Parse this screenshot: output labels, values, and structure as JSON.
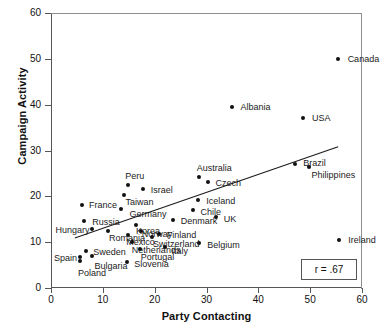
{
  "chart_data": {
    "type": "scatter",
    "title": "",
    "xlabel": "Party Contacting",
    "ylabel": "Campaign Activity",
    "xlim": [
      0,
      60
    ],
    "ylim": [
      0,
      60
    ],
    "xticks": [
      0,
      10,
      20,
      30,
      40,
      50,
      60
    ],
    "yticks": [
      0,
      10,
      20,
      30,
      40,
      50,
      60
    ],
    "grid": false,
    "legend": "none",
    "annotation": "r = .67",
    "correlation": 0.67,
    "trendline": {
      "x": [
        4.6,
        55.4
      ],
      "y": [
        10.9,
        30.8
      ]
    },
    "points": [
      {
        "label": "Canada",
        "x": 55.3,
        "y": 49.9,
        "lx": 10,
        "ly": -4
      },
      {
        "label": "Albania",
        "x": 35.0,
        "y": 39.5,
        "lx": 8,
        "ly": -4
      },
      {
        "label": "USA",
        "x": 48.6,
        "y": 37.0,
        "lx": 9,
        "ly": -4
      },
      {
        "label": "Brazil",
        "x": 47.1,
        "y": 27.1,
        "lx": 8,
        "ly": -5
      },
      {
        "label": "Philippines",
        "x": 49.7,
        "y": 26.4,
        "lx": 3,
        "ly": 4
      },
      {
        "label": "Australia",
        "x": 28.5,
        "y": 24.2,
        "lx": -2,
        "ly": -13
      },
      {
        "label": "Czech",
        "x": 30.2,
        "y": 23.2,
        "lx": 8,
        "ly": -3
      },
      {
        "label": "Peru",
        "x": 14.9,
        "y": 22.4,
        "lx": -3,
        "ly": -13
      },
      {
        "label": "Israel",
        "x": 17.7,
        "y": 21.6,
        "lx": 8,
        "ly": -3
      },
      {
        "label": "Taiwan",
        "x": 14.0,
        "y": 20.4,
        "lx": 2,
        "ly": 3
      },
      {
        "label": "Iceland",
        "x": 28.4,
        "y": 19.2,
        "lx": 8,
        "ly": -3
      },
      {
        "label": "France",
        "x": 6.0,
        "y": 18.1,
        "lx": 7,
        "ly": -4
      },
      {
        "label": "Germany",
        "x": 13.6,
        "y": 17.2,
        "lx": 8,
        "ly": 1
      },
      {
        "label": "Chile",
        "x": 27.3,
        "y": 17.1,
        "lx": 8,
        "ly": -2
      },
      {
        "label": "UK",
        "x": 31.8,
        "y": 15.6,
        "lx": 8,
        "ly": -2
      },
      {
        "label": "Denmark",
        "x": 23.5,
        "y": 14.8,
        "lx": 8,
        "ly": -3
      },
      {
        "label": "Russia",
        "x": 6.4,
        "y": 14.6,
        "lx": 8,
        "ly": -3
      },
      {
        "label": "Korea,",
        "x": 16.4,
        "y": 13.7,
        "lx": 0,
        "ly": 2
      },
      {
        "label": "Hungary",
        "x": 8.0,
        "y": 12.8,
        "lx": -37,
        "ly": -3
      },
      {
        "label": "Romania",
        "x": 11.0,
        "y": 12.5,
        "lx": 1,
        "ly": 3
      },
      {
        "label": "Norway",
        "x": 17.3,
        "y": 12.5,
        "lx": 1,
        "ly": -1
      },
      {
        "label": "Finland",
        "x": 20.8,
        "y": 11.8,
        "lx": 8,
        "ly": -3
      },
      {
        "label": "Mexico",
        "x": 14.9,
        "y": 11.6,
        "lx": -2,
        "ly": 3
      },
      {
        "label": "Switzerland",
        "x": 19.5,
        "y": 11.1,
        "lx": 1,
        "ly": 3
      },
      {
        "label": "Netherlands",
        "x": 15.6,
        "y": 10.0,
        "lx": 0,
        "ly": 4
      },
      {
        "label": "Belgium",
        "x": 28.6,
        "y": 9.8,
        "lx": 8,
        "ly": -2
      },
      {
        "label": "Ireland",
        "x": 55.6,
        "y": 10.4,
        "lx": 9,
        "ly": -4
      },
      {
        "label": "Italy",
        "x": 21.9,
        "y": 8.9,
        "lx": 7,
        "ly": 0
      },
      {
        "label": "Portugal",
        "x": 17.1,
        "y": 8.6,
        "lx": 1,
        "ly": 4
      },
      {
        "label": "Sweden",
        "x": 6.8,
        "y": 8.0,
        "lx": 7,
        "ly": -3
      },
      {
        "label": "Spain",
        "x": 5.6,
        "y": 6.8,
        "lx": -26,
        "ly": -3
      },
      {
        "label": "Bulgaria",
        "x": 8.0,
        "y": 7.0,
        "lx": 2,
        "ly": 6
      },
      {
        "label": "Slovenia",
        "x": 14.7,
        "y": 5.7,
        "lx": 7,
        "ly": -2
      },
      {
        "label": "Poland",
        "x": 5.6,
        "y": 5.9,
        "lx": -2,
        "ly": 8
      }
    ]
  },
  "style": {
    "point_color": "#111111",
    "axis_color": "#55565a",
    "text_color": "#111111"
  }
}
